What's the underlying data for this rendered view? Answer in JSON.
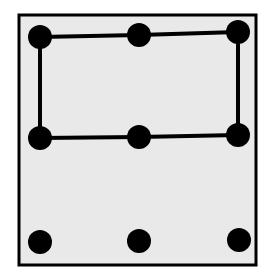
{
  "diagram": {
    "colors": {
      "background": "#ffffff",
      "panel": "#e9e9e9",
      "ink": "#000000"
    },
    "frame": {
      "x": 19,
      "y": 15,
      "width": 237,
      "height": 250
    },
    "dots": [
      {
        "id": "top-left",
        "cx": 40,
        "cy": 37
      },
      {
        "id": "top-center",
        "cx": 139,
        "cy": 35
      },
      {
        "id": "top-right",
        "cx": 238,
        "cy": 32
      },
      {
        "id": "middle-left",
        "cx": 40,
        "cy": 138
      },
      {
        "id": "middle-center",
        "cx": 139,
        "cy": 137
      },
      {
        "id": "middle-right",
        "cx": 238,
        "cy": 135
      },
      {
        "id": "bottom-left",
        "cx": 40,
        "cy": 242
      },
      {
        "id": "bottom-center",
        "cx": 139,
        "cy": 241
      },
      {
        "id": "bottom-right",
        "cx": 239,
        "cy": 240
      }
    ],
    "dot_radius": 12,
    "path": "40,37 139,35 238,32 238,135 139,137 40,138 40,37"
  }
}
